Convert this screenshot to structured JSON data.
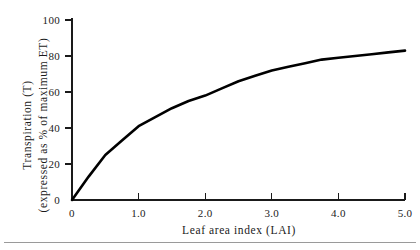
{
  "chart_data": {
    "type": "line",
    "title": "",
    "xlabel": "Leaf area index (LAI)",
    "ylabel_line1": "Transpiration (T)",
    "ylabel_line2": "(expressed as % of maximum ET)",
    "xlim": [
      0,
      5.0
    ],
    "ylim": [
      0,
      100
    ],
    "grid": false,
    "legend": "none",
    "xticks": [
      0,
      1.0,
      2.0,
      3.0,
      4.0,
      5.0
    ],
    "xtick_labels": [
      "0",
      "1.0",
      "2.0",
      "3.0",
      "4.0",
      "5.0"
    ],
    "yticks": [
      0,
      20,
      40,
      60,
      80,
      100
    ],
    "ytick_labels": [
      "0",
      "20",
      "40",
      "60",
      "80",
      "100"
    ],
    "series": [
      {
        "name": "Transpiration vs LAI",
        "color": "#000000",
        "x": [
          0.0,
          0.25,
          0.5,
          0.75,
          1.0,
          1.25,
          1.5,
          1.75,
          2.0,
          2.25,
          2.5,
          2.75,
          3.0,
          3.25,
          3.5,
          3.75,
          4.0,
          4.25,
          4.5,
          4.75,
          5.0
        ],
        "values": [
          0,
          13,
          25,
          33,
          41,
          46,
          51,
          55,
          58,
          62,
          66,
          69,
          72,
          74,
          76,
          78,
          79,
          80,
          81,
          82,
          83
        ]
      }
    ]
  },
  "axes": {
    "x_axis_name": "x-axis",
    "y_axis_name": "y-axis"
  }
}
